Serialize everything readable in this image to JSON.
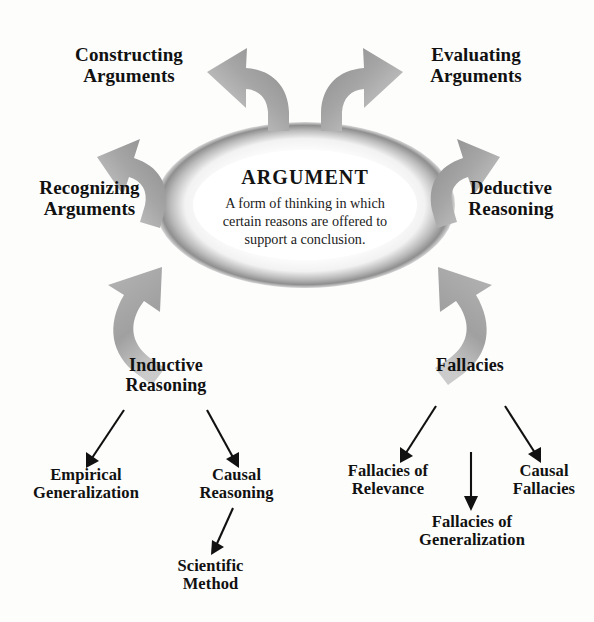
{
  "diagram": {
    "center": {
      "heading": "ARGUMENT",
      "body_line1": "A form of thinking in which",
      "body_line2": "certain reasons are offered to",
      "body_line3": "support a conclusion."
    },
    "spokes": [
      {
        "id": "constructing-arguments",
        "line1": "Constructing",
        "line2": "Arguments",
        "position": "top-left"
      },
      {
        "id": "evaluating-arguments",
        "line1": "Evaluating",
        "line2": "Arguments",
        "position": "top-right"
      },
      {
        "id": "recognizing-arguments",
        "line1": "Recognizing",
        "line2": "Arguments",
        "position": "left"
      },
      {
        "id": "deductive-reasoning",
        "line1": "Deductive",
        "line2": "Reasoning",
        "position": "right"
      },
      {
        "id": "inductive-reasoning",
        "line1": "Inductive",
        "line2": "Reasoning",
        "position": "bottom-left"
      },
      {
        "id": "fallacies",
        "line1": "Fallacies",
        "line2": "",
        "position": "bottom-right"
      }
    ],
    "branches": {
      "inductive": {
        "root": "Inductive Reasoning",
        "children": [
          {
            "id": "empirical-generalization",
            "line1": "Empirical",
            "line2": "Generalization"
          },
          {
            "id": "causal-reasoning",
            "line1": "Causal",
            "line2": "Reasoning"
          }
        ],
        "grandchild": {
          "id": "scientific-method",
          "line1": "Scientific",
          "line2": "Method",
          "parent": "causal-reasoning"
        }
      },
      "fallacies": {
        "root": "Fallacies",
        "children": [
          {
            "id": "fallacies-of-relevance",
            "line1": "Fallacies of",
            "line2": "Relevance"
          },
          {
            "id": "fallacies-of-generalization",
            "line1": "Fallacies of",
            "line2": "Generalization"
          },
          {
            "id": "causal-fallacies",
            "line1": "Causal",
            "line2": "Fallacies"
          }
        ]
      }
    },
    "colors": {
      "arrow_light": "#cfcfcf",
      "arrow_mid": "#9a9a9a",
      "arrow_dark": "#7d7d7d",
      "text": "#111111",
      "ring_shadow": "#8d8d8d",
      "background": "#ffffff"
    }
  }
}
